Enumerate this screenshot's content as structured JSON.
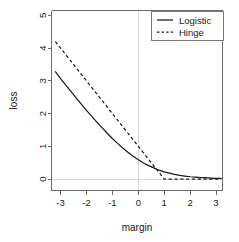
{
  "chart_data": {
    "type": "line",
    "title": "",
    "subtitle": "",
    "xlabel": "margin",
    "ylabel": "loss",
    "xlim": [
      -3.35,
      3.25
    ],
    "ylim": [
      -0.35,
      5.15
    ],
    "xticks": [
      -3,
      -2,
      -1,
      0,
      1,
      2,
      3
    ],
    "xticklabels": [
      "-3",
      "-2",
      "-1",
      "0",
      "1",
      "2",
      "3"
    ],
    "yticks": [
      0,
      1,
      2,
      3,
      4,
      5
    ],
    "yticklabels": [
      "0",
      "1",
      "2",
      "3",
      "4",
      "5"
    ],
    "grid": false,
    "reference_lines": [
      {
        "axis": "x",
        "value": 0,
        "color": "#d8d8d8"
      },
      {
        "axis": "y",
        "value": 0,
        "color": "#d8d8d8"
      }
    ],
    "legend": {
      "position": "top-right",
      "border": true,
      "entries": [
        {
          "name": "Logistic",
          "style": "solid",
          "color": "#1a1a1a"
        },
        {
          "name": "Hinge",
          "style": "dashed",
          "color": "#1a1a1a"
        }
      ]
    },
    "x": [
      -3.2,
      -3.0,
      -2.8,
      -2.6,
      -2.4,
      -2.2,
      -2.0,
      -1.8,
      -1.6,
      -1.4,
      -1.2,
      -1.0,
      -0.8,
      -0.6,
      -0.4,
      -0.2,
      0.0,
      0.2,
      0.4,
      0.6,
      0.8,
      1.0,
      1.2,
      1.4,
      1.6,
      1.8,
      2.0,
      2.2,
      2.4,
      2.6,
      2.8,
      3.0,
      3.2
    ],
    "series": [
      {
        "name": "Logistic",
        "style": "solid",
        "formula": "log2(1 + exp(-margin))",
        "values": [
          3.28,
          3.07,
          2.87,
          2.68,
          2.48,
          2.29,
          2.1,
          1.92,
          1.74,
          1.57,
          1.4,
          1.24,
          1.09,
          0.95,
          0.82,
          0.7,
          0.59,
          0.49,
          0.41,
          0.34,
          0.27,
          0.22,
          0.18,
          0.14,
          0.11,
          0.09,
          0.07,
          0.06,
          0.04,
          0.04,
          0.03,
          0.02,
          0.02
        ]
      },
      {
        "name": "Hinge",
        "style": "dashed",
        "formula": "max(0, 1 - margin)",
        "values": [
          4.2,
          4.0,
          3.8,
          3.6,
          3.4,
          3.2,
          3.0,
          2.8,
          2.6,
          2.4,
          2.2,
          2.0,
          1.8,
          1.6,
          1.4,
          1.2,
          1.0,
          0.8,
          0.6,
          0.4,
          0.2,
          0.0,
          0.0,
          0.0,
          0.0,
          0.0,
          0.0,
          0.0,
          0.0,
          0.0,
          0.0,
          0.0,
          0.0
        ]
      }
    ]
  }
}
